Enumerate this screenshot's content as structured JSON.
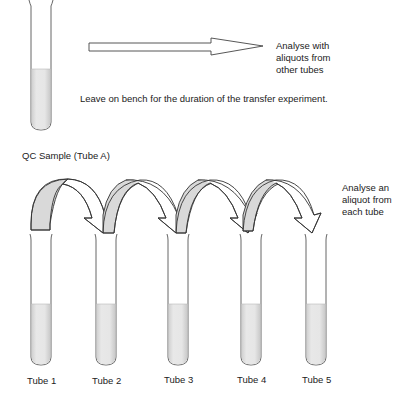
{
  "top": {
    "note": "Leave on bench for the duration of the transfer experiment.",
    "arrow_label_lines": [
      "Analyse with",
      "aliquots from",
      "other tubes"
    ]
  },
  "qc_label": "QC Sample (Tube A)",
  "side_label_lines": [
    "Analyse an",
    "aliquot from",
    "each tube"
  ],
  "tubes": [
    {
      "label": "Tube 1"
    },
    {
      "label": "Tube 2"
    },
    {
      "label": "Tube 3"
    },
    {
      "label": "Tube 4"
    },
    {
      "label": "Tube 5"
    }
  ],
  "colors": {
    "stroke": "#333333",
    "arrow_fill_shaded": "#d9d9d9",
    "liquid": "#e3e3e3",
    "tube_glass": "#ffffff"
  }
}
